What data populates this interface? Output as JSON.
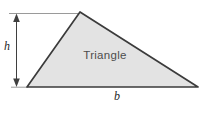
{
  "diagram": {
    "shape_label": "Triangle",
    "height_label": "h",
    "base_label": "b",
    "colors": {
      "background": "#ffffff",
      "triangle_fill": "#e3e3e3",
      "triangle_edge": "#3b3b3b",
      "dimension_line": "#3f3f3f",
      "reference_line": "#9a9a9a",
      "shape_label_text": "#4d4d4d",
      "dim_label_text": "#1f1f1f"
    }
  }
}
